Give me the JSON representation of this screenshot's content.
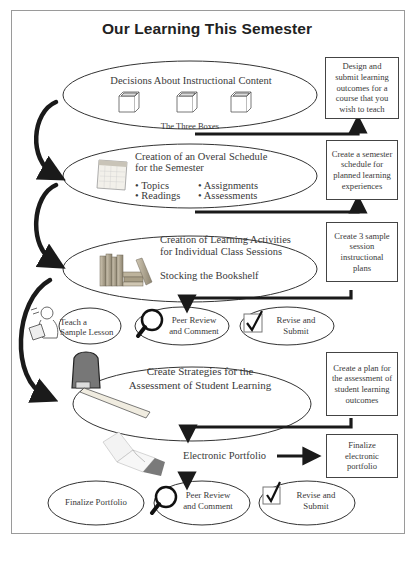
{
  "title": "Our Learning This Semester",
  "stages": [
    {
      "label": "Decisions About Instructional Content",
      "icon": "three-boxes-icon",
      "caption": "The Three Boxes",
      "task": "Design and submit learning outcomes for a course that you wish to teach"
    },
    {
      "label_line1": "Creation of an Overal Schedule",
      "label_line2": "for the Semester",
      "icon": "calendar-icon",
      "bullets": [
        "Topics",
        "Readings",
        "Assignments",
        "Assessments"
      ],
      "task": "Create a semester schedule for planned learning experiences"
    },
    {
      "label_line1": "Creation of Learning Activities",
      "label_line2": "for Individual Class Sessions",
      "caption": "Stocking the Bookshelf",
      "icon": "books-icon",
      "task": "Create 3 sample session instructional plans"
    },
    {
      "label_line1": "Create Strategies for the",
      "label_line2": "Assessment of Student Learning",
      "icon": "tape-measure-icon",
      "task": "Create a plan for the assessment of student learning outcomes"
    },
    {
      "label": "Electronic Portfolio",
      "icon": "portfolio-folder-icon",
      "task": "Finalize electronic portfolio"
    }
  ],
  "session_steps": [
    {
      "line1": "Teach a",
      "line2": "Sample Lesson",
      "icon": "teacher-icon"
    },
    {
      "line1": "Peer Review",
      "line2": "and Comment",
      "icon": "magnifier-icon"
    },
    {
      "line1": "Revise and",
      "line2": "Submit",
      "icon": "checkbox-icon"
    }
  ],
  "portfolio_steps": [
    {
      "line1": "Finalize Portfolio"
    },
    {
      "line1": "Peer Review",
      "line2": "and Comment",
      "icon": "magnifier-icon"
    },
    {
      "line1": "Revise and",
      "line2": "Submit",
      "icon": "checkbox-icon"
    }
  ],
  "colors": {
    "arrow": "#1a1a1a",
    "outline": "#333333",
    "text": "#3a3a3a"
  }
}
